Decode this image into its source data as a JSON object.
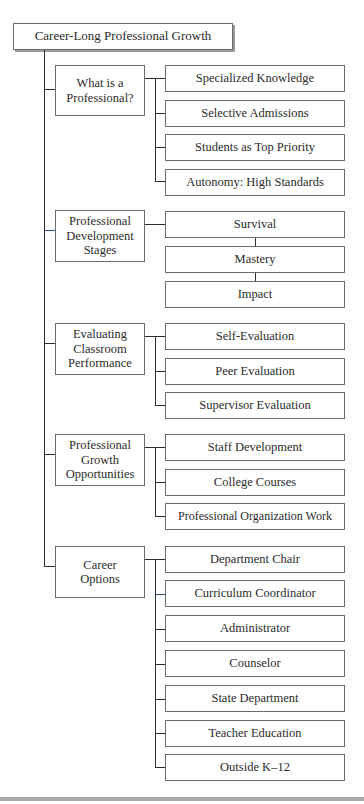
{
  "diagram": {
    "root": "Career-Long Professional Growth",
    "categories": [
      {
        "label": "What is a Professional?",
        "items": [
          "Specialized Knowledge",
          "Selective Admissions",
          "Students as Top Priority",
          "Autonomy: High Standards"
        ]
      },
      {
        "label": "Professional Development Stages",
        "items": [
          "Survival",
          "Mastery",
          "Impact"
        ]
      },
      {
        "label": "Evaluating Classroom Performance",
        "items": [
          "Self-Evaluation",
          "Peer Evaluation",
          "Supervisor Evaluation"
        ]
      },
      {
        "label": "Professional Growth Opportunities",
        "items": [
          "Staff Development",
          "College Courses",
          "Professional Organization Work"
        ]
      },
      {
        "label": "Career Options",
        "items": [
          "Department Chair",
          "Curriculum Coordinator",
          "Administrator",
          "Counselor",
          "State Department",
          "Teacher Education",
          "Outside K–12"
        ]
      }
    ]
  }
}
